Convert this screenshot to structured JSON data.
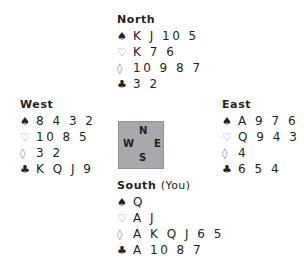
{
  "hands": {
    "north": {
      "name": "North",
      "suffix": "",
      "spades": "K J 10 5",
      "hearts": "K 7 6",
      "diamonds": "10 9 8 7",
      "clubs": "3 2"
    },
    "west": {
      "name": "West",
      "suffix": "",
      "spades": "8 4 3 2",
      "hearts": "10 8 5",
      "diamonds": "3 2",
      "clubs": "K Q J 9"
    },
    "east": {
      "name": "East",
      "suffix": "",
      "spades": "A 9 7 6",
      "hearts": "Q 9 4 3 2",
      "diamonds": "4",
      "clubs": "6 5 4"
    },
    "south": {
      "name": "South",
      "suffix": "(You)",
      "spades": "Q",
      "hearts": "A J",
      "diamonds": "A K Q J 6 5",
      "clubs": "A 10 8 7"
    }
  },
  "suits": {
    "spades": "♠",
    "hearts": "♡",
    "diamonds": "◊",
    "clubs": "♣"
  },
  "compass": {
    "n": "N",
    "w": "W",
    "e": "E",
    "s": "S"
  },
  "colors": {
    "compass_bg": "#a7a9ab",
    "text": "#231f20"
  }
}
